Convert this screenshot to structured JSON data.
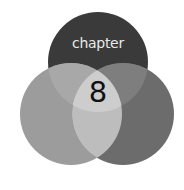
{
  "chapter_badge": {
    "title": "chapter",
    "number": "8",
    "colors": {
      "top_circle": "#3a3a3a",
      "left_circle": "#9c9c9c",
      "right_circle": "#6c6c6c",
      "top_left_overlap": "#a8a8a8",
      "top_right_overlap": "#7e7e7e",
      "left_right_overlap": "#bdbdbd",
      "center_overlap": "#cdcdcd",
      "title_text": "#e8e8e8",
      "number_text": "#111111"
    }
  }
}
